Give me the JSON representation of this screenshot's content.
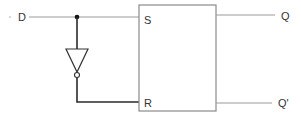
{
  "diagram": {
    "input": {
      "label": "D"
    },
    "block": {
      "inputs": [
        {
          "label": "S"
        },
        {
          "label": "R"
        }
      ],
      "outputs": [
        {
          "label": "Q"
        },
        {
          "label": "Q'"
        }
      ]
    },
    "components": [
      {
        "type": "wire",
        "from": "D",
        "to": "S"
      },
      {
        "type": "junction",
        "at": "D-line"
      },
      {
        "type": "inverter",
        "from": "junction",
        "to": "R"
      },
      {
        "type": "wire",
        "from": "block",
        "to": "Q"
      },
      {
        "type": "wire",
        "from": "block",
        "to": "Q'"
      }
    ],
    "colors": {
      "thin_wire": "#9a9a9a",
      "thick_wire": "#2b2b2b",
      "box_border": "#8a8a8a",
      "text": "#333333"
    }
  }
}
